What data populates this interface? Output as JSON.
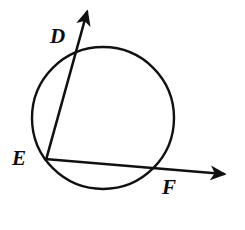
{
  "figure": {
    "background_color": "#ffffff",
    "stroke_color": "#111111",
    "label_color": "#0d0d0d"
  },
  "circle": {
    "name": "circle",
    "center_x": 103,
    "center_y": 118,
    "radius": 71,
    "stroke_width": 2.4
  },
  "points": [
    {
      "id": "D",
      "label": "D",
      "x": 73,
      "y": 51,
      "label_x": 50,
      "label_y": 26
    },
    {
      "id": "E",
      "label": "E",
      "x": 46,
      "y": 159,
      "label_x": 12,
      "label_y": 148
    },
    {
      "id": "F",
      "label": "F",
      "x": 157,
      "y": 169,
      "label_x": 162,
      "label_y": 177
    }
  ],
  "rays": [
    {
      "id": "ray-ED",
      "from_point": "E",
      "through_point": "D",
      "x1": 46,
      "y1": 160,
      "x2": 87,
      "y2": 12,
      "stroke_width": 2.6,
      "arrowhead": "end"
    },
    {
      "id": "ray-EF",
      "from_point": "E",
      "through_point": "F",
      "x1": 45,
      "y1": 159,
      "x2": 224,
      "y2": 174,
      "stroke_width": 2.6,
      "arrowhead": "end"
    }
  ]
}
